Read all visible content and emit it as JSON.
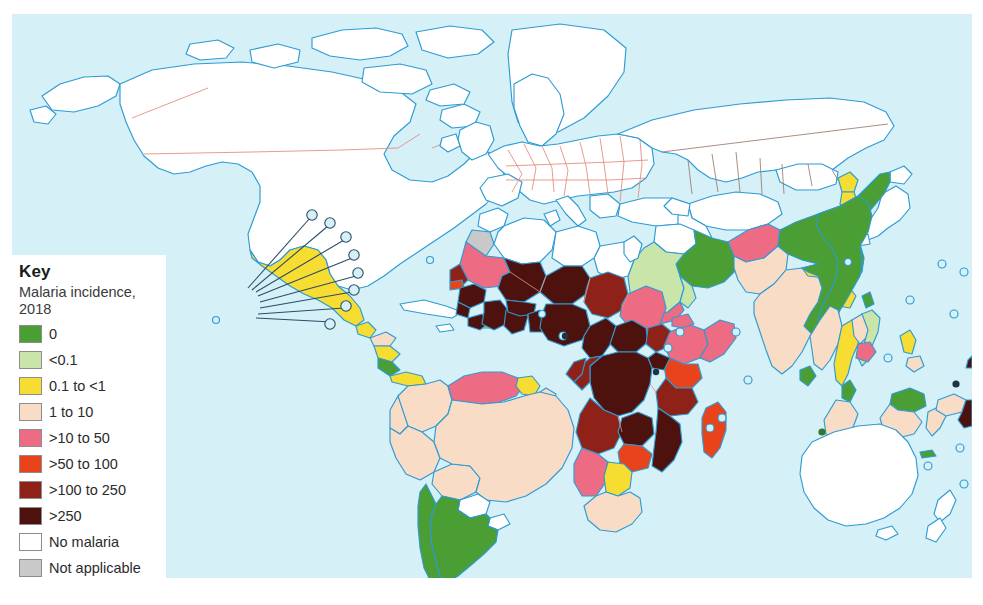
{
  "figure": {
    "type": "choropleth-world-map",
    "background_color": "#d5f0f7",
    "ocean_color": "#d5f0f7",
    "coastline_color": "#2d9bd4",
    "internal_border_color": "#e08a7a"
  },
  "legend": {
    "title": "Key",
    "subtitle": "Malaria incidence,\n2018",
    "subtitle_line1": "Malaria incidence,",
    "subtitle_line2": "2018",
    "items": [
      {
        "label": "0",
        "color": "#4a9e33"
      },
      {
        "label": "<0.1",
        "color": "#c9e5aa"
      },
      {
        "label": "0.1 to <1",
        "color": "#f7dc32"
      },
      {
        "label": "1 to 10",
        "color": "#f8dcc5"
      },
      {
        "label": ">10 to 50",
        "color": "#ee6b84"
      },
      {
        "label": ">50 to 100",
        "color": "#e8431a"
      },
      {
        "label": ">100 to 250",
        "color": "#8e2218"
      },
      {
        "label": ">250",
        "color": "#4d120d"
      },
      {
        "label": "No malaria",
        "color": "#ffffff"
      },
      {
        "label": "Not applicable",
        "color": "#c9c9c9"
      }
    ]
  },
  "chart_data": {
    "type": "map",
    "title": "Malaria incidence, 2018",
    "measure": "Malaria incidence (cases per 1000 population at risk)",
    "year": "2018",
    "classes": [
      "0",
      "<0.1",
      "0.1 to <1",
      "1 to 10",
      ">10 to 50",
      ">50 to 100",
      ">100 to 250",
      ">250",
      "No malaria",
      "Not applicable"
    ],
    "regions": [
      {
        "name": "Canada",
        "class": "No malaria"
      },
      {
        "name": "United States",
        "class": "No malaria"
      },
      {
        "name": "Greenland",
        "class": "No malaria"
      },
      {
        "name": "Mexico",
        "class": "0.1 to <1"
      },
      {
        "name": "Guatemala",
        "class": "0.1 to <1"
      },
      {
        "name": "Honduras",
        "class": "1 to 10"
      },
      {
        "name": "Nicaragua",
        "class": "0.1 to <1"
      },
      {
        "name": "Costa Rica",
        "class": "0"
      },
      {
        "name": "Panama",
        "class": "0.1 to <1"
      },
      {
        "name": "Cuba",
        "class": "No malaria"
      },
      {
        "name": "Haiti",
        "class": "0.1 to <1"
      },
      {
        "name": "Dominican Republic",
        "class": "0.1 to <1"
      },
      {
        "name": "Colombia",
        "class": "1 to 10"
      },
      {
        "name": "Venezuela",
        "class": ">10 to 50"
      },
      {
        "name": "Guyana",
        "class": "0.1 to <1"
      },
      {
        "name": "Suriname",
        "class": "1 to 10"
      },
      {
        "name": "Ecuador",
        "class": "1 to 10"
      },
      {
        "name": "Peru",
        "class": "1 to 10"
      },
      {
        "name": "Bolivia",
        "class": "1 to 10"
      },
      {
        "name": "Brazil",
        "class": "1 to 10"
      },
      {
        "name": "Paraguay",
        "class": "0"
      },
      {
        "name": "Uruguay",
        "class": "No malaria"
      },
      {
        "name": "Argentina",
        "class": "0"
      },
      {
        "name": "Chile",
        "class": "No malaria"
      },
      {
        "name": "Europe",
        "class": "No malaria"
      },
      {
        "name": "Russia",
        "class": "No malaria"
      },
      {
        "name": "Morocco",
        "class": "No malaria"
      },
      {
        "name": "Western Sahara",
        "class": "Not applicable"
      },
      {
        "name": "Algeria",
        "class": "No malaria"
      },
      {
        "name": "Libya",
        "class": "No malaria"
      },
      {
        "name": "Egypt",
        "class": "No malaria"
      },
      {
        "name": "Mauritania",
        "class": ">10 to 50"
      },
      {
        "name": "Mali",
        "class": ">250"
      },
      {
        "name": "Niger",
        "class": ">250"
      },
      {
        "name": "Chad",
        "class": ">100 to 250"
      },
      {
        "name": "Sudan",
        "class": ">10 to 50"
      },
      {
        "name": "Senegal",
        "class": ">100 to 250"
      },
      {
        "name": "Gambia",
        "class": ">50 to 100"
      },
      {
        "name": "Guinea",
        "class": ">250"
      },
      {
        "name": "Sierra Leone",
        "class": ">250"
      },
      {
        "name": "Liberia",
        "class": ">250"
      },
      {
        "name": "Cote d'Ivoire",
        "class": ">250"
      },
      {
        "name": "Ghana",
        "class": ">250"
      },
      {
        "name": "Burkina Faso",
        "class": ">250"
      },
      {
        "name": "Benin",
        "class": ">250"
      },
      {
        "name": "Nigeria",
        "class": ">250"
      },
      {
        "name": "Cameroon",
        "class": ">250"
      },
      {
        "name": "Central African Republic",
        "class": ">250"
      },
      {
        "name": "South Sudan",
        "class": ">100 to 250"
      },
      {
        "name": "Ethiopia",
        "class": ">10 to 50"
      },
      {
        "name": "Eritrea",
        "class": ">10 to 50"
      },
      {
        "name": "Somalia",
        "class": ">10 to 50"
      },
      {
        "name": "Kenya",
        "class": ">50 to 100"
      },
      {
        "name": "Uganda",
        "class": ">250"
      },
      {
        "name": "Democratic Republic of the Congo",
        "class": ">250"
      },
      {
        "name": "Congo",
        "class": ">100 to 250"
      },
      {
        "name": "Gabon",
        "class": ">100 to 250"
      },
      {
        "name": "Tanzania",
        "class": ">100 to 250"
      },
      {
        "name": "Angola",
        "class": ">100 to 250"
      },
      {
        "name": "Zambia",
        "class": ">250"
      },
      {
        "name": "Mozambique",
        "class": ">250"
      },
      {
        "name": "Zimbabwe",
        "class": ">50 to 100"
      },
      {
        "name": "Namibia",
        "class": ">10 to 50"
      },
      {
        "name": "Botswana",
        "class": "0.1 to <1"
      },
      {
        "name": "South Africa",
        "class": "1 to 10"
      },
      {
        "name": "Madagascar",
        "class": ">50 to 100"
      },
      {
        "name": "Saudi Arabia",
        "class": "<0.1"
      },
      {
        "name": "Yemen",
        "class": ">10 to 50"
      },
      {
        "name": "Oman",
        "class": "<0.1"
      },
      {
        "name": "Iran",
        "class": "0"
      },
      {
        "name": "Iraq",
        "class": "No malaria"
      },
      {
        "name": "Turkey",
        "class": "No malaria"
      },
      {
        "name": "Afghanistan",
        "class": ">10 to 50"
      },
      {
        "name": "Pakistan",
        "class": "1 to 10"
      },
      {
        "name": "India",
        "class": "1 to 10"
      },
      {
        "name": "Nepal",
        "class": "0.1 to <1"
      },
      {
        "name": "Bhutan",
        "class": "0.1 to <1"
      },
      {
        "name": "Bangladesh",
        "class": "0.1 to <1"
      },
      {
        "name": "Sri Lanka",
        "class": "0"
      },
      {
        "name": "China",
        "class": "0"
      },
      {
        "name": "Mongolia",
        "class": "No malaria"
      },
      {
        "name": "North Korea",
        "class": "0.1 to <1"
      },
      {
        "name": "South Korea",
        "class": "0.1 to <1"
      },
      {
        "name": "Japan",
        "class": "No malaria"
      },
      {
        "name": "Myanmar",
        "class": "1 to 10"
      },
      {
        "name": "Thailand",
        "class": "0.1 to <1"
      },
      {
        "name": "Laos",
        "class": "1 to 10"
      },
      {
        "name": "Vietnam",
        "class": "<0.1"
      },
      {
        "name": "Cambodia",
        "class": ">10 to 50"
      },
      {
        "name": "Malaysia",
        "class": "0"
      },
      {
        "name": "Indonesia",
        "class": "1 to 10"
      },
      {
        "name": "Philippines",
        "class": "0.1 to <1"
      },
      {
        "name": "Papua New Guinea",
        "class": ">250"
      },
      {
        "name": "Timor-Leste",
        "class": "0"
      },
      {
        "name": "Australia",
        "class": "No malaria"
      },
      {
        "name": "New Zealand",
        "class": "No malaria"
      },
      {
        "name": "Solomon Islands",
        "class": ">250"
      }
    ]
  }
}
